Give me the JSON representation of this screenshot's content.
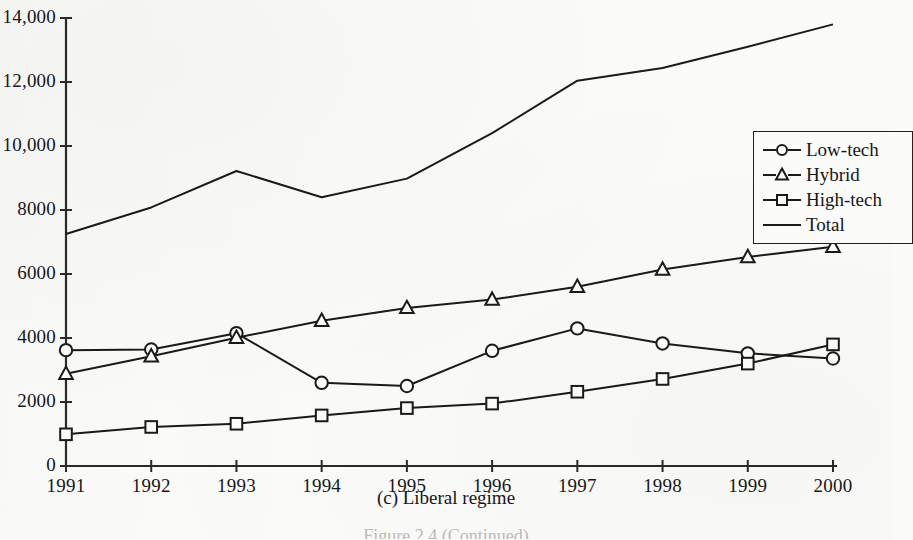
{
  "caption": "(c) Liberal regime",
  "figure_note": "Figure 2.4  (Continued)",
  "legend": {
    "position": "inside-right",
    "entries": [
      {
        "label": "Low-tech",
        "marker": "circle-marker-icon"
      },
      {
        "label": "Hybrid",
        "marker": "triangle-marker-icon"
      },
      {
        "label": "High-tech",
        "marker": "square-marker-icon"
      },
      {
        "label": "Total",
        "marker": "line-marker-icon"
      }
    ]
  },
  "axes": {
    "y_ticks": [
      "0",
      "2000",
      "4000",
      "6000",
      "8000",
      "10,000",
      "12,000",
      "14,000"
    ],
    "x_ticks": [
      "1991",
      "1992",
      "1993",
      "1994",
      "1995",
      "1996",
      "1997",
      "1998",
      "1999",
      "2000"
    ]
  },
  "colors": {
    "ink": "#1a1a1a",
    "paper": "#fbfbf9",
    "axis": "#2a2a2a"
  },
  "chart_data": {
    "type": "line",
    "title": "(c) Liberal regime",
    "xlabel": "",
    "ylabel": "",
    "xlim": [
      1991,
      2000
    ],
    "ylim": [
      0,
      14000
    ],
    "ytick_interval": 2000,
    "grid": false,
    "legend_position": "inside-right",
    "categories": [
      "1991",
      "1992",
      "1993",
      "1994",
      "1995",
      "1996",
      "1997",
      "1998",
      "1999",
      "2000"
    ],
    "series": [
      {
        "name": "Low-tech",
        "marker": "circle",
        "values": [
          3620,
          3640,
          4150,
          2600,
          2500,
          3600,
          4300,
          3830,
          3520,
          3360
        ]
      },
      {
        "name": "Hybrid",
        "marker": "triangle",
        "values": [
          2880,
          3430,
          4010,
          4540,
          4940,
          5200,
          5600,
          6140,
          6530,
          6850
        ]
      },
      {
        "name": "High-tech",
        "marker": "square",
        "values": [
          990,
          1220,
          1320,
          1580,
          1810,
          1950,
          2320,
          2720,
          3200,
          3800
        ]
      },
      {
        "name": "Total",
        "marker": "none",
        "values": [
          7250,
          8080,
          9220,
          8400,
          8980,
          10400,
          12040,
          12440,
          13100,
          13800
        ]
      }
    ]
  }
}
